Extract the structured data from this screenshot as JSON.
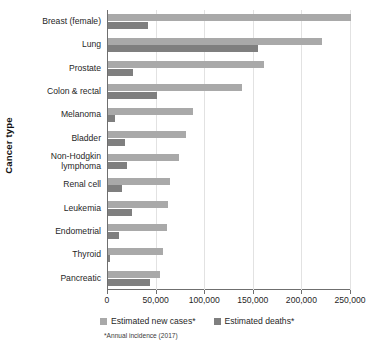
{
  "chart_data": {
    "type": "bar",
    "orientation": "horizontal",
    "title": "",
    "xlabel": "",
    "ylabel": "Cancer type",
    "xlim": [
      0,
      250000
    ],
    "xticks": [
      0,
      50000,
      100000,
      150000,
      200000,
      250000
    ],
    "xtick_labels": [
      "0",
      "50,000",
      "100,000",
      "150,000",
      "200,000",
      "250,000"
    ],
    "grid": true,
    "grid_axis": "x",
    "legend_position": "bottom",
    "categories": [
      "Breast (female)",
      "Lung",
      "Prostate",
      "Colon & rectal",
      "Melanoma",
      "Bladder",
      "Non-Hodgkin\nlymphoma",
      "Renal cell",
      "Leukemia",
      "Endometrial",
      "Thyroid",
      "Pancreatic"
    ],
    "series": [
      {
        "name": "Estimated new cases*",
        "color": "#a9a9a9",
        "values": [
          250000,
          220000,
          161000,
          138000,
          87000,
          80000,
          73000,
          64000,
          62000,
          61000,
          57000,
          54000
        ]
      },
      {
        "name": "Estimated deaths*",
        "color": "#7f7f7f",
        "values": [
          41000,
          154000,
          26000,
          50000,
          7000,
          17000,
          20000,
          14000,
          25000,
          11000,
          2000,
          43000
        ]
      }
    ],
    "footnote": "*Annual incidence (2017)"
  },
  "axes": {
    "y_title": "Cancer type"
  },
  "legend": {
    "items": [
      {
        "label": "Estimated new cases*",
        "color": "#a9a9a9"
      },
      {
        "label": "Estimated deaths*",
        "color": "#7f7f7f"
      }
    ]
  }
}
